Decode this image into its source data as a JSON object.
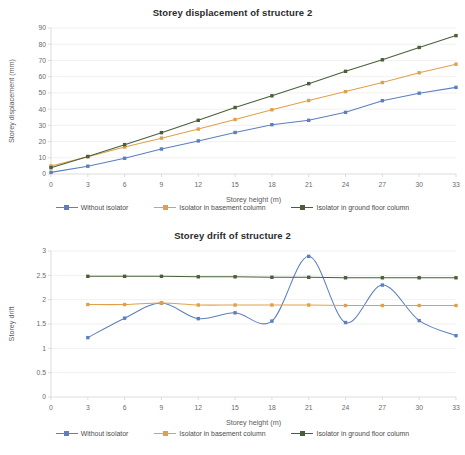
{
  "charts": [
    {
      "id": "storey-displacement",
      "title": "Storey displacement of structure 2",
      "xlabel": "Storey height (m)",
      "ylabel": "Storey displacement (mm)"
    },
    {
      "id": "storey-drift",
      "title": "Storey drift of structure 2",
      "xlabel": "Storey height (m)",
      "ylabel": "Storey drift"
    }
  ],
  "legend": {
    "items": [
      {
        "label": "Without isolator",
        "color": "#5b7fbf"
      },
      {
        "label": "Isolator in basement column",
        "color": "#e0a04b"
      },
      {
        "label": "Isolator in ground floor column",
        "color": "#4a5f39"
      }
    ]
  },
  "chart_data": [
    {
      "type": "line",
      "title": "Storey displacement of structure 2",
      "xlabel": "Storey height (m)",
      "ylabel": "Storey displacement (mm)",
      "x": [
        0,
        3,
        6,
        9,
        12,
        15,
        18,
        21,
        24,
        27,
        30,
        33
      ],
      "xticks": [
        0,
        3,
        6,
        9,
        12,
        15,
        18,
        21,
        24,
        27,
        30,
        33
      ],
      "yticks": [
        0,
        10,
        20,
        30,
        40,
        50,
        60,
        70,
        80,
        90
      ],
      "xlim": [
        0,
        33
      ],
      "ylim": [
        0,
        90
      ],
      "grid": true,
      "legend_position": "bottom",
      "smooth": false,
      "series": [
        {
          "name": "Without isolator",
          "color": "#5b7fbf",
          "values": [
            1.0,
            4.8,
            9.7,
            15.4,
            20.4,
            25.6,
            30.4,
            33.1,
            38.0,
            45.2,
            49.8,
            53.4
          ]
        },
        {
          "name": "Isolator in basement column",
          "color": "#e0a04b",
          "values": [
            5.0,
            10.7,
            16.6,
            22.1,
            27.7,
            33.6,
            39.6,
            45.3,
            50.8,
            56.4,
            62.4,
            67.7
          ]
        },
        {
          "name": "Isolator in ground floor column",
          "color": "#4a5f39",
          "values": [
            3.9,
            10.8,
            18.1,
            25.5,
            33.1,
            41.0,
            48.2,
            55.7,
            63.3,
            70.4,
            78.0,
            85.3
          ]
        }
      ]
    },
    {
      "type": "line",
      "title": "Storey drift of structure 2",
      "xlabel": "Storey height (m)",
      "ylabel": "Storey drift",
      "x": [
        3,
        6,
        9,
        12,
        15,
        18,
        21,
        24,
        27,
        30,
        33
      ],
      "xticks": [
        0,
        3,
        6,
        9,
        12,
        15,
        18,
        21,
        24,
        27,
        30,
        33
      ],
      "yticks": [
        0,
        0.5,
        1,
        1.5,
        2,
        2.5,
        3
      ],
      "xlim": [
        0,
        33
      ],
      "ylim": [
        0,
        3
      ],
      "grid": true,
      "legend_position": "bottom",
      "smooth": true,
      "series": [
        {
          "name": "Without isolator",
          "color": "#5b7fbf",
          "values": [
            1.22,
            1.62,
            1.93,
            1.61,
            1.73,
            1.56,
            2.89,
            1.53,
            2.3,
            1.57,
            1.26
          ]
        },
        {
          "name": "Isolator in basement column",
          "color": "#e0a04b",
          "values": [
            1.9,
            1.9,
            1.93,
            1.89,
            1.89,
            1.89,
            1.89,
            1.88,
            1.88,
            1.88,
            1.88
          ]
        },
        {
          "name": "Isolator in ground floor column",
          "color": "#4a5f39",
          "values": [
            2.48,
            2.48,
            2.48,
            2.47,
            2.47,
            2.46,
            2.46,
            2.45,
            2.45,
            2.45,
            2.45
          ]
        }
      ]
    }
  ]
}
